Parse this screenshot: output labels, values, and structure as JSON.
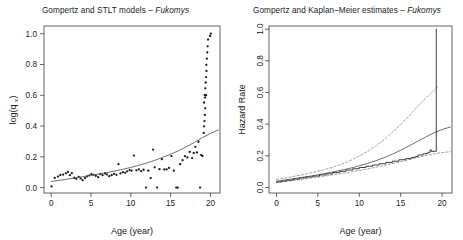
{
  "figure": {
    "background": "#ffffff",
    "foreground": "#1a1a1a",
    "panel_count": 2
  },
  "panels": {
    "left": {
      "title_main": "Gompertz and STLT models – ",
      "title_species": "Fukomys",
      "xlabel": "Age (year)",
      "ylabel_text": "log(q",
      "ylabel_sub": "x",
      "ylabel_close": ")"
    },
    "right": {
      "title_main": "Gompertz and Kaplan–Meier estimates – ",
      "title_species": "Fukomys",
      "xlabel": "Age (year)",
      "ylabel": "Hazard Rate"
    }
  },
  "chart_data": [
    {
      "id": "left-panel",
      "type": "scatter",
      "title": "Gompertz and STLT models – Fukomys",
      "xlabel": "Age (year)",
      "ylabel": "log(qx)",
      "xlim": [
        -0.9,
        21.2
      ],
      "ylim": [
        -0.035,
        1.05
      ],
      "xticks": [
        0,
        5,
        10,
        15,
        20
      ],
      "xtick_labels": [
        "0",
        "5",
        "10",
        "15",
        "20"
      ],
      "yticks": [
        0.0,
        0.2,
        0.4,
        0.6,
        0.8,
        1.0
      ],
      "ytick_labels": [
        "0.0",
        "0.2",
        "0.4",
        "0.6",
        "0.8",
        "1.0"
      ],
      "grid": false,
      "legend": "none",
      "series": [
        {
          "name": "observed log(qx)",
          "type": "scatter",
          "marker": "point",
          "color": "#1a1a1a",
          "points": [
            [
              0.05,
              0.008
            ],
            [
              0.45,
              0.063
            ],
            [
              0.85,
              0.072
            ],
            [
              1.15,
              0.082
            ],
            [
              1.5,
              0.085
            ],
            [
              1.85,
              0.093
            ],
            [
              2.1,
              0.102
            ],
            [
              2.35,
              0.081
            ],
            [
              2.6,
              0.094
            ],
            [
              2.9,
              0.064
            ],
            [
              3.15,
              0.057
            ],
            [
              3.45,
              0.07
            ],
            [
              3.7,
              0.06
            ],
            [
              3.95,
              0.048
            ],
            [
              4.25,
              0.062
            ],
            [
              4.5,
              0.073
            ],
            [
              4.8,
              0.079
            ],
            [
              5.05,
              0.088
            ],
            [
              5.3,
              0.083
            ],
            [
              5.6,
              0.077
            ],
            [
              5.9,
              0.068
            ],
            [
              6.15,
              0.088
            ],
            [
              6.45,
              0.081
            ],
            [
              6.75,
              0.092
            ],
            [
              7.0,
              0.086
            ],
            [
              7.3,
              0.074
            ],
            [
              7.6,
              0.081
            ],
            [
              7.9,
              0.089
            ],
            [
              8.2,
              0.083
            ],
            [
              8.45,
              0.152
            ],
            [
              8.7,
              0.092
            ],
            [
              9.0,
              0.1
            ],
            [
              9.3,
              0.096
            ],
            [
              9.55,
              0.106
            ],
            [
              9.85,
              0.114
            ],
            [
              10.1,
              0.11
            ],
            [
              10.4,
              0.208
            ],
            [
              10.7,
              0.112
            ],
            [
              11.0,
              0.118
            ],
            [
              11.3,
              0.107
            ],
            [
              11.6,
              0.116
            ],
            [
              11.9,
              0.0
            ],
            [
              12.2,
              0.11
            ],
            [
              12.5,
              0.062
            ],
            [
              12.8,
              0.247
            ],
            [
              13.0,
              0.132
            ],
            [
              13.3,
              0.0
            ],
            [
              13.6,
              0.12
            ],
            [
              13.9,
              0.185
            ],
            [
              14.2,
              0.118
            ],
            [
              14.5,
              0.118
            ],
            [
              14.8,
              0.128
            ],
            [
              15.1,
              0.205
            ],
            [
              15.4,
              0.11
            ],
            [
              15.7,
              0.0
            ],
            [
              15.9,
              0.0
            ],
            [
              16.2,
              0.152
            ],
            [
              16.5,
              0.178
            ],
            [
              16.8,
              0.205
            ],
            [
              17.1,
              0.196
            ],
            [
              17.4,
              0.232
            ],
            [
              17.7,
              0.192
            ],
            [
              17.9,
              0.225
            ],
            [
              18.1,
              0.265
            ],
            [
              18.3,
              0.228
            ],
            [
              18.5,
              0.298
            ],
            [
              18.7,
              0.0
            ],
            [
              18.85,
              0.212
            ],
            [
              19.0,
              0.205
            ],
            [
              19.15,
              0.355
            ],
            [
              19.2,
              0.398
            ],
            [
              19.25,
              0.432
            ],
            [
              19.3,
              0.472
            ],
            [
              19.35,
              0.515
            ],
            [
              19.2,
              0.553
            ],
            [
              19.32,
              0.585
            ],
            [
              19.28,
              0.602
            ],
            [
              19.45,
              0.6
            ],
            [
              19.35,
              0.645
            ],
            [
              19.4,
              0.683
            ],
            [
              19.45,
              0.718
            ],
            [
              19.5,
              0.758
            ],
            [
              19.48,
              0.798
            ],
            [
              19.55,
              0.838
            ],
            [
              19.6,
              0.878
            ],
            [
              19.65,
              0.918
            ],
            [
              19.7,
              0.962
            ],
            [
              19.95,
              0.985
            ],
            [
              20.05,
              1.0
            ]
          ]
        },
        {
          "name": "Gompertz fitted curve",
          "type": "line",
          "style": "solid",
          "color": "#555555",
          "points": [
            [
              0.0,
              0.04
            ],
            [
              1.0,
              0.047
            ],
            [
              2.0,
              0.055
            ],
            [
              3.0,
              0.063
            ],
            [
              4.0,
              0.071
            ],
            [
              5.0,
              0.08
            ],
            [
              6.0,
              0.089
            ],
            [
              7.0,
              0.098
            ],
            [
              8.0,
              0.108
            ],
            [
              9.0,
              0.119
            ],
            [
              10.0,
              0.131
            ],
            [
              11.0,
              0.145
            ],
            [
              12.0,
              0.16
            ],
            [
              13.0,
              0.177
            ],
            [
              14.0,
              0.196
            ],
            [
              15.0,
              0.217
            ],
            [
              16.0,
              0.24
            ],
            [
              17.0,
              0.266
            ],
            [
              18.0,
              0.295
            ],
            [
              19.0,
              0.325
            ],
            [
              20.0,
              0.352
            ],
            [
              21.0,
              0.375
            ]
          ]
        }
      ]
    },
    {
      "id": "right-panel",
      "type": "line",
      "title": "Gompertz and Kaplan–Meier estimates – Fukomys",
      "xlabel": "Age (year)",
      "ylabel": "Hazard Rate",
      "xlim": [
        -0.9,
        21.2
      ],
      "ylim": [
        -0.035,
        1.02
      ],
      "xticks": [
        0,
        5,
        10,
        15,
        20
      ],
      "xtick_labels": [
        "0",
        "5",
        "10",
        "15",
        "20"
      ],
      "yticks": [
        0.0,
        0.2,
        0.4,
        0.6,
        0.8,
        1.0
      ],
      "ytick_labels": [
        "0.0",
        "0.2",
        "0.4",
        "0.6",
        "0.8",
        "1.0"
      ],
      "grid": false,
      "legend": "none",
      "series": [
        {
          "name": "Gompertz hazard estimate",
          "type": "line",
          "style": "solid",
          "color": "#555555",
          "points": [
            [
              0.0,
              0.04
            ],
            [
              1.0,
              0.047
            ],
            [
              2.0,
              0.055
            ],
            [
              3.0,
              0.063
            ],
            [
              4.0,
              0.071
            ],
            [
              5.0,
              0.08
            ],
            [
              6.0,
              0.09
            ],
            [
              7.0,
              0.1
            ],
            [
              8.0,
              0.111
            ],
            [
              9.0,
              0.123
            ],
            [
              10.0,
              0.137
            ],
            [
              11.0,
              0.152
            ],
            [
              12.0,
              0.169
            ],
            [
              13.0,
              0.188
            ],
            [
              14.0,
              0.21
            ],
            [
              15.0,
              0.235
            ],
            [
              16.0,
              0.262
            ],
            [
              17.0,
              0.29
            ],
            [
              18.0,
              0.318
            ],
            [
              19.0,
              0.345
            ],
            [
              20.0,
              0.366
            ],
            [
              21.0,
              0.382
            ]
          ]
        },
        {
          "name": "Gompertz upper confidence band",
          "type": "line",
          "style": "dashed",
          "color": "#8a8a8a",
          "points": [
            [
              0.0,
              0.052
            ],
            [
              1.0,
              0.06
            ],
            [
              2.0,
              0.069
            ],
            [
              3.0,
              0.079
            ],
            [
              4.0,
              0.09
            ],
            [
              5.0,
              0.102
            ],
            [
              6.0,
              0.116
            ],
            [
              7.0,
              0.132
            ],
            [
              8.0,
              0.15
            ],
            [
              9.0,
              0.172
            ],
            [
              10.0,
              0.198
            ],
            [
              11.0,
              0.228
            ],
            [
              12.0,
              0.262
            ],
            [
              13.0,
              0.302
            ],
            [
              14.0,
              0.348
            ],
            [
              15.0,
              0.398
            ],
            [
              16.0,
              0.452
            ],
            [
              17.0,
              0.508
            ],
            [
              18.0,
              0.562
            ],
            [
              19.0,
              0.612
            ],
            [
              19.6,
              0.64
            ]
          ]
        },
        {
          "name": "Gompertz lower confidence band",
          "type": "line",
          "style": "dashed",
          "color": "#8a8a8a",
          "points": [
            [
              0.0,
              0.031
            ],
            [
              1.0,
              0.037
            ],
            [
              2.0,
              0.044
            ],
            [
              3.0,
              0.051
            ],
            [
              4.0,
              0.058
            ],
            [
              5.0,
              0.065
            ],
            [
              6.0,
              0.073
            ],
            [
              7.0,
              0.081
            ],
            [
              8.0,
              0.089
            ],
            [
              9.0,
              0.098
            ],
            [
              10.0,
              0.107
            ],
            [
              11.0,
              0.117
            ],
            [
              12.0,
              0.128
            ],
            [
              13.0,
              0.139
            ],
            [
              14.0,
              0.151
            ],
            [
              15.0,
              0.163
            ],
            [
              16.0,
              0.176
            ],
            [
              17.0,
              0.189
            ],
            [
              18.0,
              0.201
            ],
            [
              19.0,
              0.212
            ],
            [
              20.0,
              0.22
            ],
            [
              21.0,
              0.226
            ]
          ]
        },
        {
          "name": "Kaplan–Meier step estimate",
          "type": "step",
          "style": "solid",
          "color": "#1a1a1a",
          "points": [
            [
              0.0,
              0.035
            ],
            [
              0.6,
              0.04
            ],
            [
              1.2,
              0.046
            ],
            [
              2.0,
              0.053
            ],
            [
              2.8,
              0.06
            ],
            [
              3.6,
              0.066
            ],
            [
              4.4,
              0.072
            ],
            [
              5.2,
              0.079
            ],
            [
              6.0,
              0.086
            ],
            [
              6.8,
              0.094
            ],
            [
              7.6,
              0.102
            ],
            [
              8.4,
              0.11
            ],
            [
              9.2,
              0.118
            ],
            [
              10.0,
              0.126
            ],
            [
              10.8,
              0.134
            ],
            [
              11.6,
              0.142
            ],
            [
              12.4,
              0.15
            ],
            [
              13.2,
              0.158
            ],
            [
              14.0,
              0.166
            ],
            [
              14.8,
              0.175
            ],
            [
              15.6,
              0.182
            ],
            [
              16.3,
              0.19
            ],
            [
              16.8,
              0.196
            ],
            [
              17.1,
              0.205
            ],
            [
              17.4,
              0.205
            ],
            [
              17.7,
              0.212
            ],
            [
              18.0,
              0.214
            ],
            [
              18.3,
              0.222
            ],
            [
              18.55,
              0.237
            ],
            [
              18.7,
              0.228
            ],
            [
              18.9,
              0.228
            ],
            [
              19.05,
              0.228
            ],
            [
              19.25,
              0.228
            ],
            [
              19.3,
              1.0
            ],
            [
              19.35,
              1.0
            ]
          ]
        }
      ]
    }
  ]
}
